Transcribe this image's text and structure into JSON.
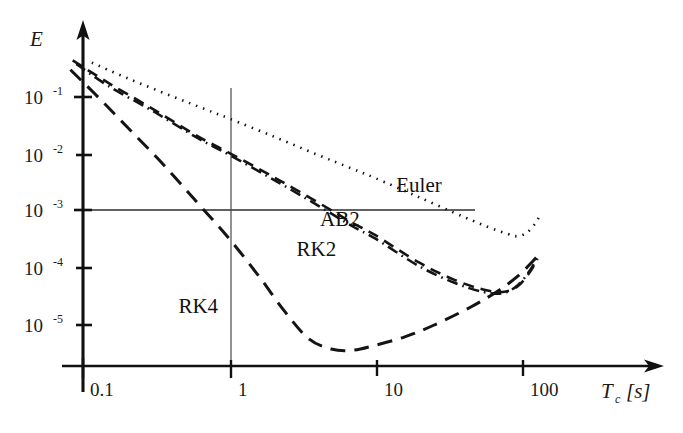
{
  "chart_data": {
    "type": "line",
    "title": "",
    "xlabel": "T_c [s]",
    "ylabel": "E",
    "xscale": "log",
    "yscale": "log",
    "xlim": [
      0.07,
      180
    ],
    "ylim": [
      3e-06,
      0.6
    ],
    "xticks": [
      0.1,
      1,
      10,
      100
    ],
    "xticklabels": [
      "0.1",
      "1",
      "10",
      "100"
    ],
    "yticks": [
      0.1,
      0.01,
      0.001,
      0.0001,
      1e-05
    ],
    "yticklabels": [
      "10-1",
      "10-2",
      "10-3",
      "10-4",
      "10-5"
    ],
    "grid": false,
    "reference_lines": [
      {
        "name": "error-threshold-line",
        "orientation": "horizontal",
        "value": 0.001,
        "x_from": 0.1,
        "x_to": 46
      },
      {
        "name": "period-line",
        "orientation": "vertical",
        "value": 1.0,
        "y_from": 0.28,
        "y_to": 3.2e-06
      }
    ],
    "legend_position": "inline-annotations",
    "series": [
      {
        "name": "Euler",
        "label": "Euler",
        "linestyle": "dotted",
        "label_pos": {
          "x": 14.0,
          "y": 0.0022
        },
        "points": [
          [
            0.115,
            0.4
          ],
          [
            0.2,
            0.215
          ],
          [
            0.4,
            0.105
          ],
          [
            0.7,
            0.06
          ],
          [
            1.0,
            0.042
          ],
          [
            2.0,
            0.0205
          ],
          [
            4.0,
            0.0098
          ],
          [
            7.0,
            0.0055
          ],
          [
            10.0,
            0.0038
          ],
          [
            20.0,
            0.00175
          ],
          [
            40.0,
            0.0008
          ],
          [
            60.0,
            0.00052
          ],
          [
            80.0,
            0.0004
          ],
          [
            95.0,
            0.00036
          ],
          [
            110.0,
            0.00042
          ],
          [
            125.0,
            0.0006
          ],
          [
            135.0,
            0.00085
          ]
        ]
      },
      {
        "name": "AB2",
        "label": "AB2",
        "linestyle": "dashed",
        "label_pos": {
          "x": 4.2,
          "y": 0.00055
        },
        "points": [
          [
            0.085,
            0.44
          ],
          [
            0.15,
            0.175
          ],
          [
            0.3,
            0.062
          ],
          [
            0.6,
            0.021
          ],
          [
            1.0,
            0.0105
          ],
          [
            2.0,
            0.004
          ],
          [
            4.0,
            0.00145
          ],
          [
            7.0,
            0.00062
          ],
          [
            10.0,
            0.00038
          ],
          [
            20.0,
            0.000125
          ],
          [
            35.0,
            6.2e-05
          ],
          [
            55.0,
            4.2e-05
          ],
          [
            75.0,
            3.8e-05
          ],
          [
            95.0,
            4.8e-05
          ],
          [
            115.0,
            8.5e-05
          ],
          [
            130.0,
            0.000145
          ]
        ]
      },
      {
        "name": "RK2",
        "label": "RK2",
        "linestyle": "dash-dot",
        "label_pos": {
          "x": 2.9,
          "y": 0.000165
        },
        "points": [
          [
            0.09,
            0.38
          ],
          [
            0.15,
            0.155
          ],
          [
            0.3,
            0.057
          ],
          [
            0.6,
            0.0195
          ],
          [
            1.0,
            0.0097
          ],
          [
            2.0,
            0.0036
          ],
          [
            4.0,
            0.00128
          ],
          [
            7.0,
            0.00054
          ],
          [
            10.0,
            0.00033
          ],
          [
            20.0,
            0.000108
          ],
          [
            35.0,
            5.5e-05
          ],
          [
            55.0,
            3.8e-05
          ],
          [
            75.0,
            3.6e-05
          ],
          [
            95.0,
            5e-05
          ],
          [
            115.0,
            9e-05
          ],
          [
            130.0,
            0.000155
          ]
        ]
      },
      {
        "name": "RK4",
        "label": "RK4",
        "linestyle": "long-dash",
        "label_pos": {
          "x": 0.45,
          "y": 1.6e-05
        },
        "points": [
          [
            0.082,
            0.3
          ],
          [
            0.12,
            0.115
          ],
          [
            0.2,
            0.03
          ],
          [
            0.35,
            0.0068
          ],
          [
            0.6,
            0.00145
          ],
          [
            1.0,
            0.00033
          ],
          [
            1.6,
            7.2e-05
          ],
          [
            2.4,
            1.75e-05
          ],
          [
            3.5,
            5.8e-06
          ],
          [
            5.0,
            3.8e-06
          ],
          [
            7.0,
            3.6e-06
          ],
          [
            10.0,
            4.4e-06
          ],
          [
            16.0,
            6.2e-06
          ],
          [
            25.0,
            9.8e-06
          ],
          [
            45.0,
            2.05e-05
          ],
          [
            70.0,
            4e-05
          ],
          [
            95.0,
            7.2e-05
          ],
          [
            120.0,
            0.00013
          ],
          [
            135.0,
            0.000185
          ]
        ]
      }
    ]
  },
  "axes": {
    "y_axis_name": "E",
    "x_axis_name": "Tc [s]",
    "x_axis_symbol": "T",
    "x_axis_subscript": "c",
    "x_axis_unit": "[s]",
    "tick_0": "0.1",
    "tick_1": "1",
    "tick_2": "10",
    "tick_3": "100",
    "ytick_base": "10",
    "ytick_e1": "-1",
    "ytick_e2": "-2",
    "ytick_e3": "-3",
    "ytick_e4": "-4",
    "ytick_e5": "-5"
  },
  "colors": {
    "ink": "#1a1a1a",
    "rule": "#3a3a3a",
    "background": "#ffffff"
  }
}
